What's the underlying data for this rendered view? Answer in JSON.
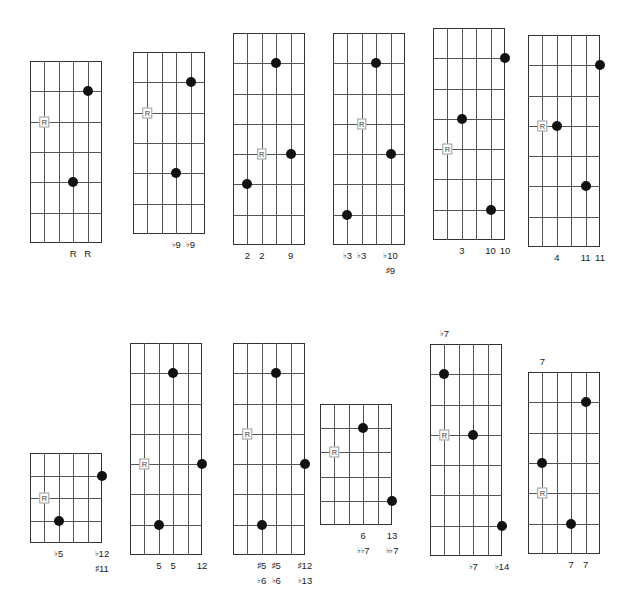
{
  "page": {
    "width": 627,
    "height": 600,
    "background": "#ffffff",
    "dot_color": "#111111",
    "line_color": "#555555",
    "border_color": "#333333",
    "root_marker_text": "R"
  },
  "diagrams": [
    {
      "id": "diagram-1",
      "name": "root",
      "x": 30,
      "y": 61,
      "w": 72,
      "h": 182,
      "strings": 6,
      "frets": 6,
      "top_labels": [],
      "dots": [
        {
          "string": 5,
          "fret_line": 1
        },
        {
          "string": 4,
          "fret_line": 4
        }
      ],
      "root_markers": [
        {
          "string": 2,
          "fret_line": 2
        }
      ],
      "bottom_labels": [
        {
          "string": 4,
          "text": "R"
        },
        {
          "string": 5,
          "text": "R"
        }
      ],
      "sub_labels": []
    },
    {
      "id": "diagram-2",
      "name": "flat-9",
      "x": 133,
      "y": 52,
      "w": 72,
      "h": 182,
      "strings": 6,
      "frets": 6,
      "top_labels": [],
      "dots": [
        {
          "string": 5,
          "fret_line": 1
        },
        {
          "string": 4,
          "fret_line": 4
        }
      ],
      "root_markers": [
        {
          "string": 2,
          "fret_line": 2
        }
      ],
      "bottom_labels": [
        {
          "string": 4,
          "acc": "♭",
          "text": "9"
        },
        {
          "string": 5,
          "acc": "♭",
          "text": "9"
        }
      ],
      "sub_labels": []
    },
    {
      "id": "diagram-3",
      "name": "major-2nd-9th",
      "x": 233,
      "y": 33,
      "w": 72,
      "h": 212,
      "strings": 6,
      "frets": 7,
      "top_labels": [],
      "dots": [
        {
          "string": 4,
          "fret_line": 1
        },
        {
          "string": 5,
          "fret_line": 4
        },
        {
          "string": 2,
          "fret_line": 5
        }
      ],
      "root_markers": [
        {
          "string": 3,
          "fret_line": 4
        }
      ],
      "bottom_labels": [
        {
          "string": 2,
          "text": "2"
        },
        {
          "string": 3,
          "text": "2"
        },
        {
          "string": 5,
          "text": "9"
        }
      ],
      "sub_labels": []
    },
    {
      "id": "diagram-4",
      "name": "flat-3-sharp-9",
      "x": 333,
      "y": 33,
      "w": 72,
      "h": 212,
      "strings": 6,
      "frets": 7,
      "top_labels": [],
      "dots": [
        {
          "string": 4,
          "fret_line": 1
        },
        {
          "string": 5,
          "fret_line": 4
        },
        {
          "string": 2,
          "fret_line": 6
        }
      ],
      "root_markers": [
        {
          "string": 3,
          "fret_line": 3
        }
      ],
      "bottom_labels": [
        {
          "string": 2,
          "acc": "♭",
          "text": "3"
        },
        {
          "string": 3,
          "acc": "♭",
          "text": "3"
        },
        {
          "string": 5,
          "acc": "♭",
          "text": "10"
        }
      ],
      "sub_labels": [
        {
          "string": 5,
          "acc": "♯",
          "text": "9"
        }
      ]
    },
    {
      "id": "diagram-5",
      "name": "major-3rd-10th",
      "x": 433,
      "y": 28,
      "w": 72,
      "h": 212,
      "strings": 6,
      "frets": 7,
      "top_labels": [],
      "dots": [
        {
          "string": 6,
          "fret_line": 1
        },
        {
          "string": 3,
          "fret_line": 3
        },
        {
          "string": 5,
          "fret_line": 6
        }
      ],
      "root_markers": [
        {
          "string": 2,
          "fret_line": 4
        }
      ],
      "bottom_labels": [
        {
          "string": 3,
          "text": "3"
        },
        {
          "string": 5,
          "text": "10"
        },
        {
          "string": 6,
          "text": "10"
        }
      ],
      "sub_labels": []
    },
    {
      "id": "diagram-6",
      "name": "perfect-4th-11th",
      "x": 528,
      "y": 35,
      "w": 72,
      "h": 212,
      "strings": 6,
      "frets": 7,
      "top_labels": [],
      "dots": [
        {
          "string": 6,
          "fret_line": 1
        },
        {
          "string": 3,
          "fret_line": 3
        },
        {
          "string": 5,
          "fret_line": 5
        }
      ],
      "root_markers": [
        {
          "string": 2,
          "fret_line": 3
        }
      ],
      "bottom_labels": [
        {
          "string": 3,
          "text": "4"
        },
        {
          "string": 5,
          "text": "11"
        },
        {
          "string": 6,
          "text": "11"
        }
      ],
      "sub_labels": []
    },
    {
      "id": "diagram-7",
      "name": "flat-5-sharp-11",
      "x": 30,
      "y": 453,
      "w": 72,
      "h": 90,
      "strings": 6,
      "frets": 4,
      "top_labels": [],
      "dots": [
        {
          "string": 6,
          "fret_line": 1
        },
        {
          "string": 3,
          "fret_line": 3
        }
      ],
      "root_markers": [
        {
          "string": 2,
          "fret_line": 2
        }
      ],
      "bottom_labels": [
        {
          "string": 3,
          "acc": "♭",
          "text": "5"
        },
        {
          "string": 6,
          "acc": "♭",
          "text": "12"
        }
      ],
      "sub_labels": [
        {
          "string": 6,
          "acc": "♯",
          "text": "11"
        }
      ]
    },
    {
      "id": "diagram-8",
      "name": "perfect-5th-12th",
      "x": 130,
      "y": 343,
      "w": 72,
      "h": 212,
      "strings": 6,
      "frets": 7,
      "top_labels": [],
      "dots": [
        {
          "string": 4,
          "fret_line": 1
        },
        {
          "string": 6,
          "fret_line": 4
        },
        {
          "string": 3,
          "fret_line": 6
        }
      ],
      "root_markers": [
        {
          "string": 2,
          "fret_line": 4
        }
      ],
      "bottom_labels": [
        {
          "string": 3,
          "text": "5"
        },
        {
          "string": 4,
          "text": "5"
        },
        {
          "string": 6,
          "text": "12"
        }
      ],
      "sub_labels": []
    },
    {
      "id": "diagram-9",
      "name": "sharp-5-flat-13",
      "x": 233,
      "y": 343,
      "w": 72,
      "h": 212,
      "strings": 6,
      "frets": 7,
      "top_labels": [],
      "dots": [
        {
          "string": 4,
          "fret_line": 1
        },
        {
          "string": 6,
          "fret_line": 4
        },
        {
          "string": 3,
          "fret_line": 6
        }
      ],
      "root_markers": [
        {
          "string": 2,
          "fret_line": 3
        }
      ],
      "bottom_labels": [
        {
          "string": 3,
          "acc": "♯",
          "text": "5"
        },
        {
          "string": 4,
          "acc": "♯",
          "text": "5"
        },
        {
          "string": 6,
          "acc": "♯",
          "text": "12"
        }
      ],
      "sub_labels": [
        {
          "string": 3,
          "acc": "♭",
          "text": "6"
        },
        {
          "string": 4,
          "acc": "♭",
          "text": "6"
        },
        {
          "string": 6,
          "acc": "♭",
          "text": "13"
        }
      ]
    },
    {
      "id": "diagram-10",
      "name": "major-6th-13th",
      "x": 320,
      "y": 404,
      "w": 72,
      "h": 121,
      "strings": 6,
      "frets": 5,
      "top_labels": [],
      "dots": [
        {
          "string": 4,
          "fret_line": 1
        },
        {
          "string": 6,
          "fret_line": 4
        }
      ],
      "root_markers": [
        {
          "string": 2,
          "fret_line": 2
        }
      ],
      "bottom_labels": [
        {
          "string": 4,
          "text": "6"
        },
        {
          "string": 6,
          "text": "13"
        }
      ],
      "sub_labels": [
        {
          "string": 4,
          "acc": "♭♭",
          "text": "7"
        },
        {
          "string": 6,
          "acc": "♭♭",
          "text": "7"
        }
      ]
    },
    {
      "id": "diagram-11",
      "name": "flat-7th-14th",
      "x": 430,
      "y": 344,
      "w": 72,
      "h": 212,
      "strings": 6,
      "frets": 7,
      "top_labels": [
        {
          "string": 2,
          "acc": "♭",
          "text": "7"
        }
      ],
      "dots": [
        {
          "string": 2,
          "fret_line": 1
        },
        {
          "string": 4,
          "fret_line": 3
        },
        {
          "string": 6,
          "fret_line": 6
        }
      ],
      "root_markers": [
        {
          "string": 2,
          "fret_line": 3
        }
      ],
      "bottom_labels": [
        {
          "string": 4,
          "acc": "♭",
          "text": "7"
        },
        {
          "string": 6,
          "acc": "♭",
          "text": "14"
        }
      ],
      "sub_labels": []
    },
    {
      "id": "diagram-12",
      "name": "major-7th",
      "x": 528,
      "y": 372,
      "w": 72,
      "h": 182,
      "strings": 6,
      "frets": 6,
      "top_labels": [
        {
          "string": 2,
          "text": "7"
        }
      ],
      "dots": [
        {
          "string": 5,
          "fret_line": 1
        },
        {
          "string": 2,
          "fret_line": 3
        },
        {
          "string": 4,
          "fret_line": 5
        }
      ],
      "root_markers": [
        {
          "string": 2,
          "fret_line": 4
        }
      ],
      "bottom_labels": [
        {
          "string": 4,
          "text": "7"
        },
        {
          "string": 5,
          "text": "7"
        }
      ],
      "sub_labels": []
    }
  ]
}
